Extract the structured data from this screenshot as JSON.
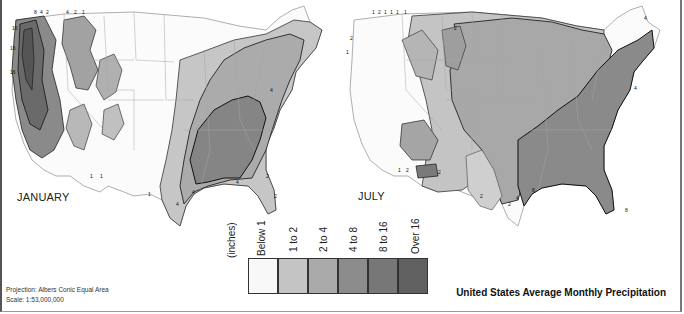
{
  "maps": [
    {
      "id": "january",
      "label": "JANUARY",
      "contour_labels": [
        "16",
        "8",
        "4",
        "2",
        "1",
        "16",
        "16",
        "4",
        "2",
        "1",
        "1",
        "1",
        "2",
        "4",
        "4",
        "2",
        "2",
        "2",
        "1",
        "4",
        "2",
        "4"
      ]
    },
    {
      "id": "july",
      "label": "JULY",
      "contour_labels": [
        "1",
        "2",
        "1",
        "1",
        "1",
        "1",
        "2",
        "2",
        "1",
        "2",
        "2",
        "2",
        "4",
        "4",
        "4",
        "2",
        "4",
        "8",
        "8",
        "2",
        "2",
        "1",
        "2"
      ]
    }
  ],
  "legend": {
    "unit_label": "(inches)",
    "items": [
      {
        "label": "Below 1",
        "color": "#f8f8f8"
      },
      {
        "label": "1 to 2",
        "color": "#c4c4c4"
      },
      {
        "label": "2 to 4",
        "color": "#aaaaaa"
      },
      {
        "label": "4 to 8",
        "color": "#8c8c8c"
      },
      {
        "label": "8 to 16",
        "color": "#777777"
      },
      {
        "label": "Over 16",
        "color": "#606060"
      }
    ]
  },
  "info": {
    "projection": "Projection: Albers Conic Equal Area",
    "scale": "Scale: 1:53,000,000"
  },
  "title": "United States Average Monthly Precipitation"
}
